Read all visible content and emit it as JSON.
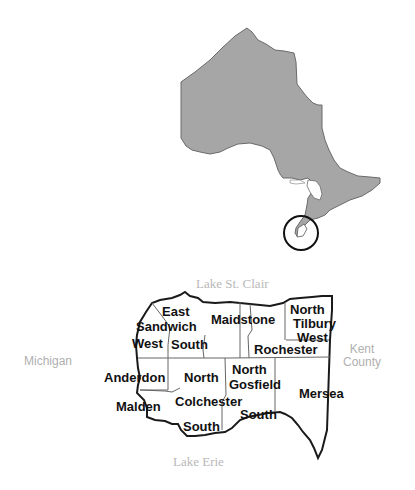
{
  "colors": {
    "province_fill": "#a6a6a6",
    "province_stroke": "#6a6a6a",
    "county_outline": "#1a1a1a",
    "township_border": "#555555",
    "label_dark": "#111111",
    "label_faint": "#b5b5b5"
  },
  "overview_map": {
    "region": "Ontario",
    "highlight": "circle around Essex County"
  },
  "neighbors": {
    "north_water": "Lake St. Clair",
    "south_water": "Lake Erie",
    "west": "Michigan",
    "east_line1": "Kent",
    "east_line2": "County"
  },
  "townships": [
    {
      "line1": "East",
      "line2": "Sandwich",
      "line3": "West"
    },
    {
      "line1": "Sandwich",
      "line2": "South"
    },
    {
      "line1": "Maidstone"
    },
    {
      "line1": "North",
      "line2": "Tilbury",
      "line3": "West"
    },
    {
      "line1": "Rochester"
    },
    {
      "line1": "Anderdon"
    },
    {
      "line1": "North",
      "line2": "Colchester",
      "line3": "South"
    },
    {
      "line1": "North",
      "line2": "Gosfield",
      "line3": "South"
    },
    {
      "line1": "Mersea"
    },
    {
      "line1": "Malden"
    }
  ],
  "labels": {
    "east": "East",
    "sandwich": "Sandwich",
    "west": "West",
    "south1": "South",
    "maidstone": "Maidstone",
    "north_tilbury_1": "North",
    "north_tilbury_2": "Tilbury",
    "north_tilbury_3": "West",
    "rochester": "Rochester",
    "anderdon": "Anderdon",
    "north_colchester": "North",
    "colchester": "Colchester",
    "south_colchester": "South",
    "north_gosfield": "North",
    "gosfield": "Gosfield",
    "south_gosfield": "South",
    "mersea": "Mersea",
    "malden": "Malden"
  }
}
